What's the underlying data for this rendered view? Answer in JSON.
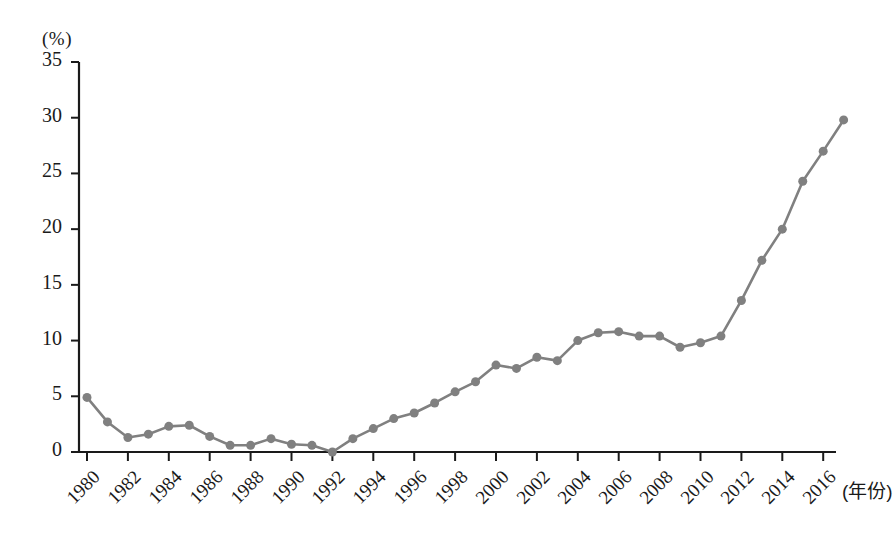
{
  "chart_data": {
    "type": "line",
    "title": "",
    "subtitle": "",
    "xlabel": "(年份)",
    "ylabel": "(%)",
    "x": [
      1980,
      1981,
      1982,
      1983,
      1984,
      1985,
      1986,
      1987,
      1988,
      1989,
      1990,
      1991,
      1992,
      1993,
      1994,
      1995,
      1996,
      1997,
      1998,
      1999,
      2000,
      2001,
      2002,
      2003,
      2004,
      2005,
      2006,
      2007,
      2008,
      2009,
      2010,
      2011,
      2012,
      2013,
      2014,
      2015,
      2016,
      2017
    ],
    "values": [
      4.9,
      2.7,
      1.3,
      1.6,
      2.3,
      2.4,
      1.4,
      0.6,
      0.6,
      1.2,
      0.7,
      0.6,
      0.0,
      1.2,
      2.1,
      3.0,
      3.5,
      4.4,
      5.4,
      6.3,
      7.8,
      7.5,
      8.5,
      8.2,
      10.0,
      10.7,
      10.8,
      10.4,
      10.4,
      9.4,
      9.8,
      10.4,
      13.6,
      17.2,
      20.0,
      24.3,
      27.0,
      29.8
    ],
    "series": [
      {
        "name": "比例",
        "values": [
          4.9,
          2.7,
          1.3,
          1.6,
          2.3,
          2.4,
          1.4,
          0.6,
          0.6,
          1.2,
          0.7,
          0.6,
          0.0,
          1.2,
          2.1,
          3.0,
          3.5,
          4.4,
          5.4,
          6.3,
          7.8,
          7.5,
          8.5,
          8.2,
          10.0,
          10.7,
          10.8,
          10.4,
          10.4,
          9.4,
          9.8,
          10.4,
          13.6,
          17.2,
          20.0,
          24.3,
          27.0,
          29.8
        ]
      }
    ],
    "xtick_labels": [
      "1980",
      "1982",
      "1984",
      "1986",
      "1988",
      "1990",
      "1992",
      "1994",
      "1996",
      "1998",
      "2000",
      "2002",
      "2004",
      "2006",
      "2008",
      "2010",
      "2012",
      "2014",
      "2016"
    ],
    "xtick_values": [
      1980,
      1982,
      1984,
      1986,
      1988,
      1990,
      1992,
      1994,
      1996,
      1998,
      2000,
      2002,
      2004,
      2006,
      2008,
      2010,
      2012,
      2014,
      2016
    ],
    "ytick_labels": [
      "0",
      "5",
      "10",
      "15",
      "20",
      "25",
      "30",
      "35"
    ],
    "ytick_values": [
      0,
      5,
      10,
      15,
      20,
      25,
      30,
      35
    ],
    "xlim": [
      1979.3,
      2018.3
    ],
    "ylim": [
      0,
      35
    ],
    "grid": false,
    "legend": null,
    "line_color": "#808080",
    "marker_color": "#808080",
    "axis_color": "#1a1a1a",
    "marker": "circle",
    "marker_size": 9,
    "line_width": 2.6
  }
}
